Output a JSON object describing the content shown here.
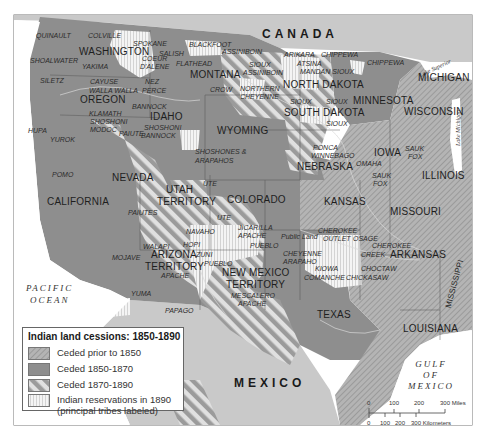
{
  "title": "Indian land cessions: 1850-1890",
  "colors": {
    "background": "#ffffff",
    "foreign_land": "#c9c9c9",
    "ceded_prior_1850": "#a9a9a9",
    "ceded_1850_1870": "#8e8e8e",
    "ceded_1870_1890_stripe_dark": "#9a9a9a",
    "ceded_1870_1890_stripe_light": "#e2e2e2",
    "reservation": "#f2f2f2",
    "water": "#ffffff",
    "border": "#555555"
  },
  "countries": {
    "canada": "CANADA",
    "mexico": "MEXICO"
  },
  "water_bodies": {
    "pacific_line1": "PACIFIC",
    "pacific_line2": "OCEAN",
    "gulf_line1": "GULF",
    "gulf_line2": "OF",
    "gulf_line3": "MEXICO",
    "lake_superior": "Lake Superior",
    "lake_michigan": "Lake Michigan"
  },
  "states": [
    {
      "name": "WASHINGTON"
    },
    {
      "name": "OREGON"
    },
    {
      "name": "IDAHO"
    },
    {
      "name": "MONTANA"
    },
    {
      "name": "NORTH DAKOTA"
    },
    {
      "name": "SOUTH DAKOTA"
    },
    {
      "name": "MINNESOTA"
    },
    {
      "name": "WISCONSIN"
    },
    {
      "name": "MICHIGAN"
    },
    {
      "name": "WYOMING"
    },
    {
      "name": "NEBRASKA"
    },
    {
      "name": "IOWA"
    },
    {
      "name": "ILLINOIS"
    },
    {
      "name": "NEVADA"
    },
    {
      "name": "UTAH"
    },
    {
      "name": "TERRITORY"
    },
    {
      "name": "COLORADO"
    },
    {
      "name": "KANSAS"
    },
    {
      "name": "MISSOURI"
    },
    {
      "name": "CALIFORNIA"
    },
    {
      "name": "ARIZONA"
    },
    {
      "name": "TERRITORY"
    },
    {
      "name": "NEW MEXICO"
    },
    {
      "name": "TERRITORY"
    },
    {
      "name": "ARKANSAS"
    },
    {
      "name": "TEXAS"
    },
    {
      "name": "LOUISIANA"
    },
    {
      "name": "MISSISSIPPI"
    }
  ],
  "tribes": [
    {
      "name": "QUINAULT"
    },
    {
      "name": "COLVILLE"
    },
    {
      "name": "SPOKANE"
    },
    {
      "name": "SHOALWATER"
    },
    {
      "name": "YAKIMA"
    },
    {
      "name": "COEUR"
    },
    {
      "name": "D'ALENE"
    },
    {
      "name": "SALISH"
    },
    {
      "name": "SILETZ"
    },
    {
      "name": "CAYUSE"
    },
    {
      "name": "WALLA WALLA"
    },
    {
      "name": "NEZ"
    },
    {
      "name": "PERCE"
    },
    {
      "name": "BLACKFOOT"
    },
    {
      "name": "FLATHEAD"
    },
    {
      "name": "ASSINIBOIN"
    },
    {
      "name": "SIOUX"
    },
    {
      "name": "ASSINIBOIN"
    },
    {
      "name": "ARIKARA"
    },
    {
      "name": "ATSINA"
    },
    {
      "name": "MANDAN SIOUX"
    },
    {
      "name": "CHIPPEWA"
    },
    {
      "name": "CHIPPEWA"
    },
    {
      "name": "CROW"
    },
    {
      "name": "NORTHERN"
    },
    {
      "name": "CHEYENNE"
    },
    {
      "name": "BANNOCK"
    },
    {
      "name": "KLAMATH"
    },
    {
      "name": "SHOSHONI"
    },
    {
      "name": "MODOC"
    },
    {
      "name": "PAIUTE"
    },
    {
      "name": "SHOSHONI"
    },
    {
      "name": "BANNOCK"
    },
    {
      "name": "HUPA"
    },
    {
      "name": "YUROK"
    },
    {
      "name": "SIOUX"
    },
    {
      "name": "SIOUX"
    },
    {
      "name": "SIOUX"
    },
    {
      "name": "SHOSHONES &"
    },
    {
      "name": "ARAPAHOS"
    },
    {
      "name": "PONCA"
    },
    {
      "name": "WINNEBAGO"
    },
    {
      "name": "OMAHA"
    },
    {
      "name": "SAUK"
    },
    {
      "name": "FOX"
    },
    {
      "name": "SAUK"
    },
    {
      "name": "FOX"
    },
    {
      "name": "POMO"
    },
    {
      "name": "UTE"
    },
    {
      "name": "PAIUTES"
    },
    {
      "name": "UTE"
    },
    {
      "name": "JICARILLA"
    },
    {
      "name": "APACHE"
    },
    {
      "name": "NAVAHO"
    },
    {
      "name": "HOPI"
    },
    {
      "name": "ZUNI"
    },
    {
      "name": "PUEBLO"
    },
    {
      "name": "PUEBLO"
    },
    {
      "name": "WALAPI"
    },
    {
      "name": "MOJAVE"
    },
    {
      "name": "APACHE"
    },
    {
      "name": "YUMA"
    },
    {
      "name": "PAPAGO"
    },
    {
      "name": "MESCALERO"
    },
    {
      "name": "APACHE"
    },
    {
      "name": "Public Land"
    },
    {
      "name": "CHEROKEE"
    },
    {
      "name": "OUTLET"
    },
    {
      "name": "OSAGE"
    },
    {
      "name": "CHEROKEE"
    },
    {
      "name": "CREEK"
    },
    {
      "name": "CHEYENNE"
    },
    {
      "name": "ARAPAHO"
    },
    {
      "name": "KIOWA"
    },
    {
      "name": "COMANCHE"
    },
    {
      "name": "CHOCTAW"
    },
    {
      "name": "CHICKASAW"
    }
  ],
  "legend": {
    "title": "Indian land cessions:  1850-1890",
    "items": [
      {
        "label": "Ceded prior to 1850",
        "pattern": "fine-diagonal"
      },
      {
        "label": "Ceded 1850-1870",
        "pattern": "solid-dark"
      },
      {
        "label": "Ceded 1870-1890",
        "pattern": "wide-diagonal"
      },
      {
        "label": "Indian reservations in 1890",
        "label2": "(principal tribes labeled)",
        "pattern": "vertical-lines"
      }
    ]
  },
  "scale_bar": {
    "miles_ticks": [
      "0",
      "100",
      "200",
      "300 Miles"
    ],
    "km_ticks": [
      "0",
      "100",
      "200",
      "300 Kilometers"
    ]
  }
}
